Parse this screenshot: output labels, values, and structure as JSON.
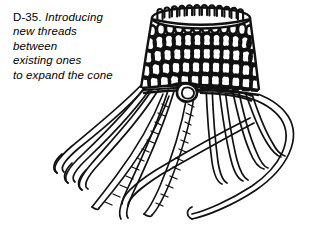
{
  "page": {
    "width": 317,
    "height": 240,
    "background_color": "#ffffff",
    "ink_color": "#111111"
  },
  "caption": {
    "figure_number": "D-35.",
    "lines": [
      "Introducing",
      "new threads",
      "between",
      "existing ones",
      "to expand the cone"
    ],
    "full_text": "D-35. Introducing new threads between existing ones to expand the cone",
    "style": "italic",
    "font_size_px": 11.5
  },
  "illustration": {
    "title": "looped-cone-with-hanging-threads",
    "description": "Line drawing of a knitted conical basket with rows of loop stitches and loose threads hanging from the base",
    "parts": {
      "rim": "top-elliptical-rim",
      "body": "looped-cone-body",
      "rows": 5,
      "stitches_per_row": 13,
      "knot": "center-braided-knot",
      "hanging_threads": 11,
      "braided_cords": 2
    }
  }
}
